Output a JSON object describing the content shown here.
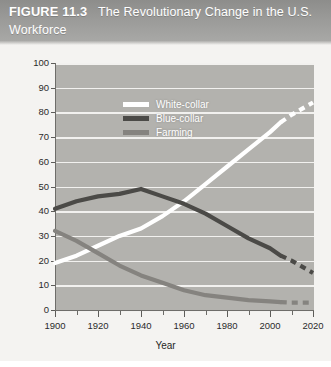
{
  "figure": {
    "number": "FIGURE 11.3",
    "title": "The Revolutionary Change in the U.S. Workforce"
  },
  "chart_data": {
    "type": "line",
    "title": "The Revolutionary Change in the U.S. Workforce",
    "xlabel": "Year",
    "ylabel": "Percentage",
    "xlim": [
      1900,
      2020
    ],
    "ylim": [
      0,
      100
    ],
    "xticks": [
      1900,
      1920,
      1940,
      1960,
      1980,
      2000,
      2020
    ],
    "xminorticks": [
      1910,
      1930,
      1950,
      1970,
      1990,
      2010
    ],
    "yticks": [
      0,
      10,
      20,
      30,
      40,
      50,
      60,
      70,
      80,
      90,
      100
    ],
    "grid": "horizontal",
    "legend_position": "upper-left-inside",
    "projection_starts": 2005,
    "x": [
      1900,
      1910,
      1920,
      1930,
      1940,
      1950,
      1960,
      1970,
      1980,
      1990,
      2000,
      2005,
      2010,
      2020
    ],
    "series": [
      {
        "name": "White-collar",
        "color": "#ffffff",
        "values": [
          19,
          22,
          26,
          30,
          33,
          38,
          44,
          51,
          58,
          65,
          72,
          76,
          79,
          84
        ]
      },
      {
        "name": "Blue-collar",
        "color": "#4b4a47",
        "values": [
          41,
          44,
          46,
          47,
          49,
          46,
          43,
          39,
          34,
          29,
          25,
          22,
          20,
          15
        ]
      },
      {
        "name": "Farming",
        "color": "#85837f",
        "values": [
          32,
          28,
          23,
          18,
          14,
          11,
          8,
          6,
          5,
          4,
          3.5,
          3.2,
          3,
          3
        ]
      }
    ]
  },
  "legend": {
    "items": [
      {
        "label": "White-collar",
        "color": "#ffffff"
      },
      {
        "label": "Blue-collar",
        "color": "#4b4a47"
      },
      {
        "label": "Farming",
        "color": "#85837f"
      }
    ]
  }
}
